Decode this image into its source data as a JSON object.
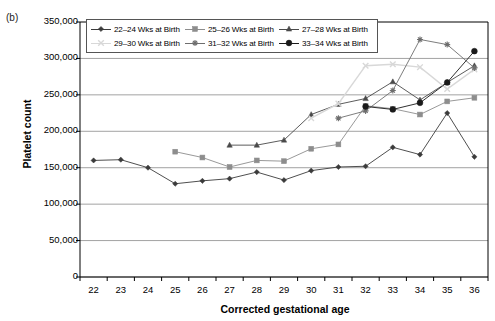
{
  "panel_label": "(b)",
  "axes": {
    "x_title": "Corrected gestational age",
    "y_title": "Platelet count",
    "y_ticks": [
      "0",
      "50,000",
      "100,000",
      "150,000",
      "200,000",
      "250,000",
      "300,000",
      "350,000"
    ],
    "x_ticks": [
      "22",
      "23",
      "24",
      "25",
      "26",
      "27",
      "28",
      "29",
      "30",
      "31",
      "32",
      "33",
      "34",
      "35",
      "36"
    ]
  },
  "legend": {
    "items": [
      {
        "label": "22–24 Wks at Birth",
        "color": "#3b3b3b",
        "marker": "diamond"
      },
      {
        "label": "25–26 Wks at Birth",
        "color": "#8d8d8d",
        "marker": "square"
      },
      {
        "label": "27–28 Wks at Birth",
        "color": "#4a4a4a",
        "marker": "triangle"
      },
      {
        "label": "29–30 Wks at Birth",
        "color": "#d8d8d8",
        "marker": "cross"
      },
      {
        "label": "31–32 Wks at Birth",
        "color": "#6e6e6e",
        "marker": "star"
      },
      {
        "label": "33–34 Wks at Birth",
        "color": "#1a1a1a",
        "marker": "circle"
      }
    ]
  },
  "chart_data": {
    "type": "line",
    "title": "",
    "xlabel": "Corrected gestational age",
    "ylabel": "Platelet count",
    "xlim": [
      21.5,
      36.5
    ],
    "ylim": [
      0,
      350000
    ],
    "ytick_step": 50000,
    "grid": "horizontal",
    "legend_position": "top-inside",
    "x": [
      22,
      23,
      24,
      25,
      26,
      27,
      28,
      29,
      30,
      31,
      32,
      33,
      34,
      35,
      36
    ],
    "series": [
      {
        "name": "22–24 Wks at Birth",
        "color": "#3b3b3b",
        "marker": "diamond",
        "x": [
          22,
          23,
          24,
          25,
          26,
          27,
          28,
          29,
          30,
          31,
          32,
          33,
          34,
          35,
          36
        ],
        "values": [
          160000,
          161000,
          150000,
          128000,
          132000,
          135000,
          144000,
          133000,
          146000,
          151000,
          152000,
          178000,
          168000,
          225000,
          165000
        ]
      },
      {
        "name": "25–26 Wks at Birth",
        "color": "#8d8d8d",
        "marker": "square",
        "x": [
          25,
          26,
          27,
          28,
          29,
          30,
          31,
          32,
          33,
          34,
          35,
          36
        ],
        "values": [
          172000,
          164000,
          151000,
          160000,
          159000,
          176000,
          182000,
          235000,
          231000,
          223000,
          241000,
          246000
        ]
      },
      {
        "name": "27–28 Wks at Birth",
        "color": "#4a4a4a",
        "marker": "triangle",
        "x": [
          27,
          28,
          29,
          30,
          31,
          32,
          33,
          34,
          35,
          36
        ],
        "values": [
          181000,
          181000,
          188000,
          223000,
          237000,
          245000,
          268000,
          243000,
          267000,
          290000
        ]
      },
      {
        "name": "29–30 Wks at Birth",
        "color": "#d8d8d8",
        "marker": "cross",
        "x": [
          30,
          31,
          32,
          33,
          34,
          35,
          36
        ],
        "values": [
          218000,
          238000,
          290000,
          292000,
          288000,
          258000,
          285000
        ]
      },
      {
        "name": "31–32 Wks at Birth",
        "color": "#6e6e6e",
        "marker": "star",
        "x": [
          31,
          32,
          33,
          34,
          35,
          36
        ],
        "values": [
          218000,
          228000,
          256000,
          326000,
          319000,
          287000
        ]
      },
      {
        "name": "33–34 Wks at Birth",
        "color": "#1a1a1a",
        "marker": "circle",
        "x": [
          32,
          33,
          34,
          35,
          36
        ],
        "values": [
          234000,
          230000,
          239000,
          267000,
          310000
        ]
      }
    ]
  }
}
